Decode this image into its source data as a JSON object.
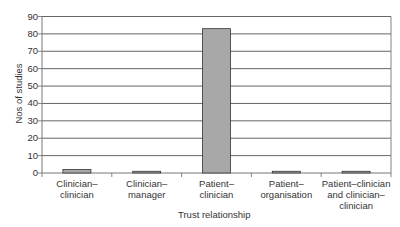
{
  "chart_data": {
    "type": "bar",
    "title": "",
    "xlabel": "Trust relationship",
    "ylabel": "Nos of studies",
    "categories": [
      "Clinician–clinician",
      "Clinician–manager",
      "Patient–clinician",
      "Patient–organisation",
      "Patient–clinician and clinician–clinician"
    ],
    "category_lines": [
      [
        "Clinician–",
        "clinician"
      ],
      [
        "Clinician–",
        "manager"
      ],
      [
        "Patient–",
        "clinician"
      ],
      [
        "Patient–",
        "organisation"
      ],
      [
        "Patient–clinician",
        "and clinician–",
        "clinician"
      ]
    ],
    "values": [
      2,
      1,
      83,
      1,
      1
    ],
    "ylim": [
      0,
      90
    ],
    "yticks": [
      0,
      10,
      20,
      30,
      40,
      50,
      60,
      70,
      80,
      90
    ],
    "grid": true,
    "legend": null,
    "colors": {
      "bar": "#a8a8a8",
      "bar_edge": "#333333",
      "grid": "#555555",
      "axis": "#777777"
    }
  }
}
